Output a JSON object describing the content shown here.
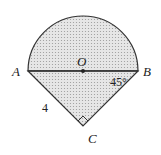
{
  "diagram": {
    "points": {
      "A": {
        "label": "A"
      },
      "B": {
        "label": "B"
      },
      "C": {
        "label": "C"
      },
      "O": {
        "label": "O"
      }
    },
    "side_label": "4",
    "angle_label": "45°",
    "colors": {
      "stroke": "#333333",
      "fill": "#d9d9d9"
    }
  }
}
